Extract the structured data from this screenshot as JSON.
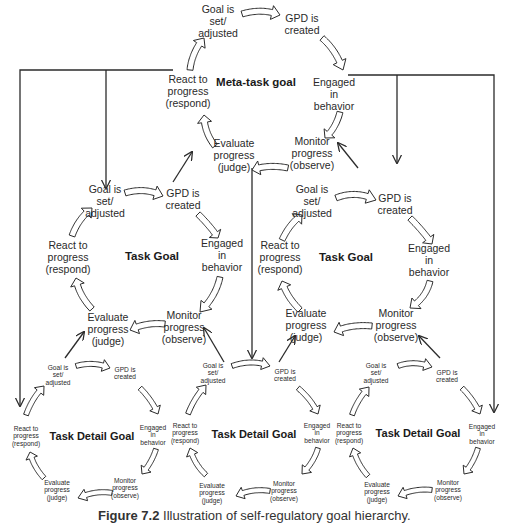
{
  "figure": {
    "caption_number": "Figure 7.2",
    "caption_text": "Illustration of self-regulatory goal hierarchy."
  },
  "cycle_steps": {
    "goal_set": "Goal is\nset/\nadjusted",
    "gpd_created": "GPD is\ncreated",
    "engaged": "Engaged\nin\nbehavior",
    "monitor": "Monitor\nprogress\n(observe)",
    "evaluate": "Evaluate\nprogress\n(judge)",
    "react": "React to\nprogress\n(respond)"
  },
  "cycles": [
    {
      "id": "meta",
      "title": "Meta-task goal",
      "level": "meta"
    },
    {
      "id": "task-left",
      "title": "Task Goal",
      "level": "task"
    },
    {
      "id": "task-right",
      "title": "Task Goal",
      "level": "task"
    },
    {
      "id": "detail-left",
      "title": "Task Detail Goal",
      "level": "detail"
    },
    {
      "id": "detail-center",
      "title": "Task Detail Goal",
      "level": "detail"
    },
    {
      "id": "detail-right",
      "title": "Task Detail Goal",
      "level": "detail"
    }
  ],
  "labels": {
    "meta": {
      "title": "Meta-task goal",
      "goal_set": "Goal is\nset/\nadjusted",
      "gpd_created": "GPD is\ncreated",
      "engaged": "Engaged\nin\nbehavior",
      "monitor": "Monitor\nprogress\n(observe)",
      "evaluate": "Evaluate\nprogress\n(judge)",
      "react": "React to\nprogress\n(respond)"
    },
    "task_left": {
      "title": "Task Goal",
      "goal_set": "Goal is\nset/\nadjusted",
      "gpd_created": "GPD is\ncreated",
      "engaged": "Engaged\nin\nbehavior",
      "monitor": "Monitor\nprogress\n(observe)",
      "evaluate": "Evaluate\nprogress\n(judge)",
      "react": "React to\nprogress\n(respond)"
    },
    "task_right": {
      "title": "Task Goal",
      "goal_set": "Goal is\nset/\nadjusted",
      "gpd_created": "GPD is\ncreated",
      "engaged": "Engaged\nin\nbehavior",
      "monitor": "Monitor\nprogress\n(observe)",
      "evaluate": "Evaluate\nprogress\n(judge)",
      "react": "React to\nprogress\n(respond)"
    },
    "detail_left": {
      "title": "Task Detail Goal",
      "goal_set": "Goal is\nset/\nadjusted",
      "gpd_created": "GPD is\ncreated",
      "engaged": "Engaged\nin\nbehavior",
      "monitor": "Monitor\nprogress\n(observe)",
      "evaluate": "Evaluate\nprogress\n(judge)",
      "react": "React to\nprogress\n(respond)"
    },
    "detail_center": {
      "title": "Task Detail Goal",
      "goal_set": "Goal is\nset/\nadjusted",
      "gpd_created": "GPD is\ncreated",
      "engaged": "Engaged\nin\nbehavior",
      "monitor": "Monitor\nprogress\n(observe)",
      "evaluate": "Evaluate\nprogress\n(judge)",
      "react": "React to\nprogress\n(respond)"
    },
    "detail_right": {
      "title": "Task Detail Goal",
      "goal_set": "Goal is\nset/\nadjusted",
      "gpd_created": "GPD is\ncreated",
      "engaged": "Engaged\nin\nbehavior",
      "monitor": "Monitor\nprogress\n(observe)",
      "evaluate": "Evaluate\nprogress\n(judge)",
      "react": "React to\nprogress\n(respond)"
    }
  },
  "colors": {
    "line": "#2b2b2b",
    "text": "#2a2a2a",
    "background": "#ffffff"
  }
}
